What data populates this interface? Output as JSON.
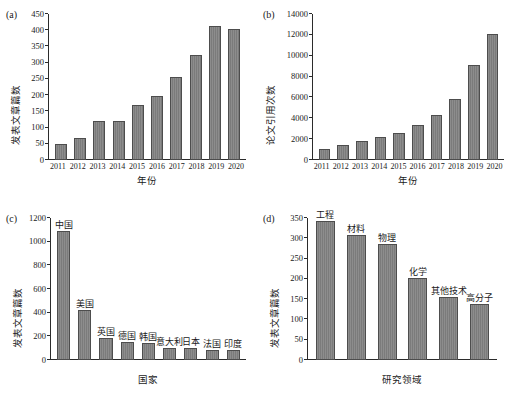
{
  "figure": {
    "background": "#ffffff",
    "bar_color": "#808080",
    "bar_edge_color": "#4d4d4d",
    "axis_color": "#2b2b2b"
  },
  "panels": {
    "a": {
      "tag": "(a)",
      "xlabel": "年份",
      "ylabel": "发表文章篇数",
      "yticks": [
        "0",
        "50",
        "100",
        "150",
        "200",
        "250",
        "300",
        "350",
        "400",
        "450"
      ]
    },
    "b": {
      "tag": "(b)",
      "xlabel": "年份",
      "ylabel": "论文引用次数",
      "yticks": [
        "0",
        "2000",
        "4000",
        "6000",
        "8000",
        "10000",
        "12000",
        "14000"
      ]
    },
    "c": {
      "tag": "(c)",
      "xlabel": "国家",
      "ylabel": "发表文章篇数",
      "yticks": [
        "0",
        "200",
        "400",
        "600",
        "800",
        "1000",
        "1200"
      ]
    },
    "d": {
      "tag": "(d)",
      "xlabel": "研究领域",
      "ylabel": "发表文章篇数",
      "yticks": [
        "0",
        "50",
        "100",
        "150",
        "200",
        "250",
        "300",
        "350"
      ]
    }
  },
  "chart_data": [
    {
      "panel": "a",
      "type": "bar",
      "title": "",
      "xlabel": "年份",
      "ylabel": "发表文章篇数",
      "categories": [
        "2011",
        "2012",
        "2013",
        "2014",
        "2015",
        "2016",
        "2017",
        "2018",
        "2019",
        "2020"
      ],
      "values": [
        48,
        68,
        120,
        119,
        170,
        198,
        255,
        324,
        414,
        403
      ],
      "ylim": [
        0,
        450
      ],
      "ytick_step": 50,
      "grid": false,
      "legend": "none"
    },
    {
      "panel": "b",
      "type": "bar",
      "title": "",
      "xlabel": "年份",
      "ylabel": "论文引用次数",
      "categories": [
        "2011",
        "2012",
        "2013",
        "2014",
        "2015",
        "2016",
        "2017",
        "2018",
        "2019",
        "2020"
      ],
      "values": [
        1100,
        1400,
        1800,
        2200,
        2600,
        3400,
        4300,
        5850,
        9150,
        12100
      ],
      "ylim": [
        0,
        14000
      ],
      "ytick_step": 2000,
      "grid": false,
      "legend": "none"
    },
    {
      "panel": "c",
      "type": "bar",
      "title": "",
      "xlabel": "国家",
      "ylabel": "发表文章篇数",
      "categories": [
        "中国",
        "美国",
        "英国",
        "德国",
        "韩国",
        "意大利",
        "日本",
        "法国",
        "印度"
      ],
      "values": [
        1090,
        425,
        190,
        155,
        140,
        105,
        98,
        85,
        82
      ],
      "ylim": [
        0,
        1200
      ],
      "ytick_step": 200,
      "grid": false,
      "legend": "none",
      "note": "bar names printed above each bar"
    },
    {
      "panel": "d",
      "type": "bar",
      "title": "",
      "xlabel": "研究领域",
      "ylabel": "发表文章篇数",
      "categories": [
        "工程",
        "材料",
        "物理",
        "化学",
        "其他技术",
        "高分子"
      ],
      "values": [
        342,
        308,
        287,
        203,
        156,
        139
      ],
      "ylim": [
        0,
        350
      ],
      "ytick_step": 50,
      "grid": false,
      "legend": "none",
      "note": "bar names printed above each bar"
    }
  ]
}
